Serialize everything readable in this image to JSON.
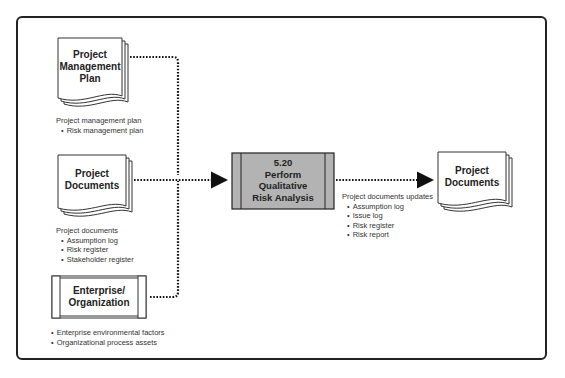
{
  "diagram": {
    "inputs": [
      {
        "id": "project-management-plan",
        "label_lines": [
          "Project",
          "Management",
          "Plan"
        ],
        "shape": "document",
        "caption_title": "Project management plan",
        "caption_items": [
          "Risk management plan"
        ]
      },
      {
        "id": "project-documents-input",
        "label_lines": [
          "Project",
          "Documents"
        ],
        "shape": "document",
        "caption_title": "Project documents",
        "caption_items": [
          "Assumption log",
          "Risk register",
          "Stakeholder register"
        ]
      },
      {
        "id": "enterprise-organization",
        "label_lines": [
          "Enterprise/",
          "Organization"
        ],
        "shape": "scroll",
        "caption_title": "",
        "caption_items": [
          "Enterprise environmental factors",
          "Organizational process assets"
        ]
      }
    ],
    "process": {
      "number": "5.20",
      "label_lines": [
        "Perform",
        "Qualitative",
        "Risk Analysis"
      ],
      "fill": "#b3b3b3"
    },
    "output": {
      "id": "project-documents-output",
      "label_lines": [
        "Project",
        "Documents"
      ],
      "shape": "document",
      "caption_title": "Project documents updates",
      "caption_items": [
        "Assumption log",
        "Issue log",
        "Risk register",
        "Risk report"
      ]
    },
    "colors": {
      "line": "#222222",
      "process_fill": "#b3b3b3",
      "frame": "#222222"
    }
  }
}
